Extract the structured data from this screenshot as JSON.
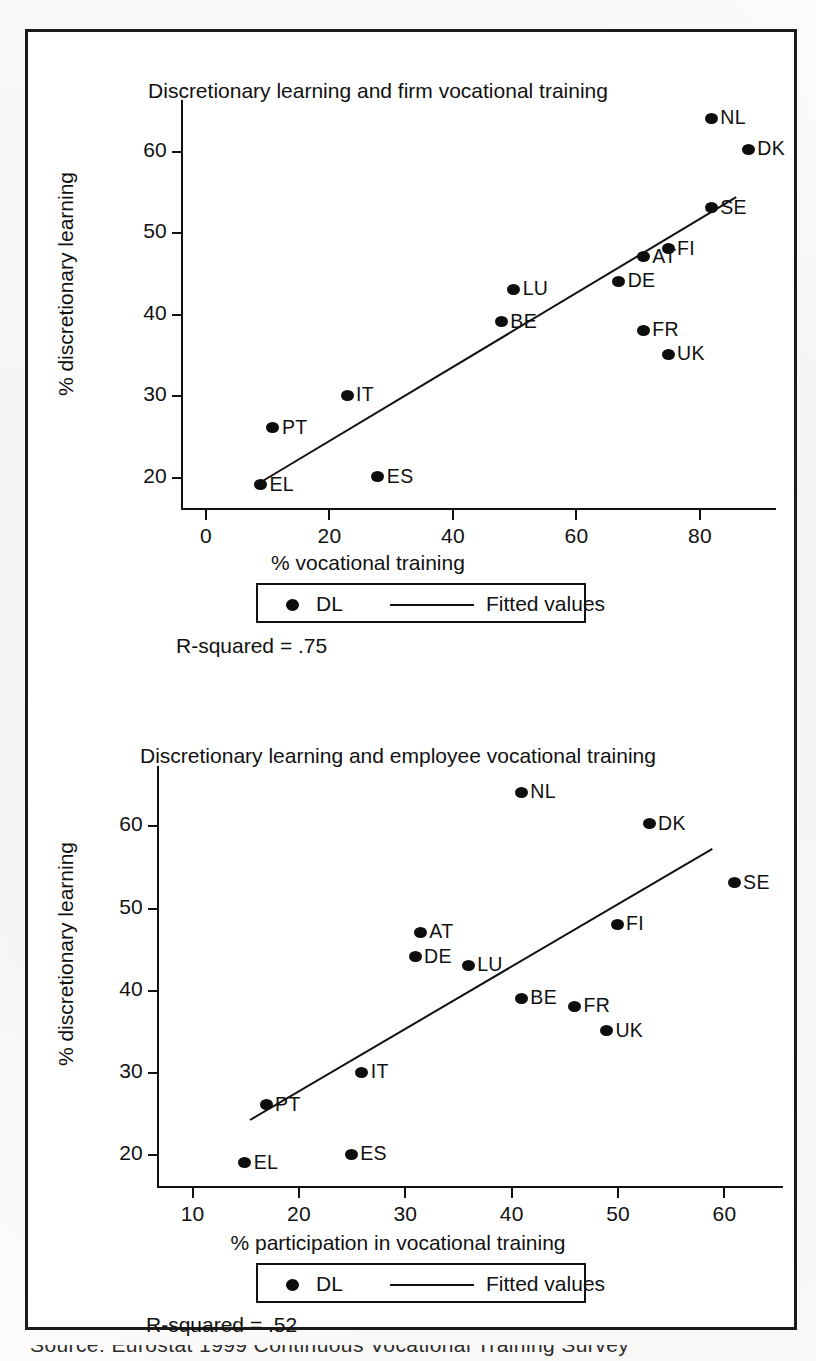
{
  "figure": {
    "caption_partial": "Source: Eurostat 1999 Continuous Vocational Training Survey"
  },
  "charts": [
    {
      "id": "chart-firm-vocational-training",
      "title": "Discretionary learning and firm vocational training",
      "rsquared_label": "R-squared = .75",
      "legend": {
        "point_label": "DL",
        "line_label": "Fitted values"
      },
      "xlabel": "% vocational training",
      "ylabel": "% discretionary learning",
      "xticks": [
        "0",
        "20",
        "40",
        "60",
        "80"
      ],
      "yticks": [
        "20",
        "30",
        "40",
        "50",
        "60"
      ],
      "points": [
        {
          "label": "NL",
          "x": 82,
          "y": 64
        },
        {
          "label": "DK",
          "x": 88,
          "y": 60.2
        },
        {
          "label": "SE",
          "x": 82,
          "y": 53
        },
        {
          "label": "FI",
          "x": 75,
          "y": 48
        },
        {
          "label": "AT",
          "x": 71,
          "y": 47
        },
        {
          "label": "DE",
          "x": 67,
          "y": 44
        },
        {
          "label": "LU",
          "x": 50,
          "y": 43
        },
        {
          "label": "BE",
          "x": 48,
          "y": 39
        },
        {
          "label": "FR",
          "x": 71,
          "y": 38
        },
        {
          "label": "UK",
          "x": 75,
          "y": 35
        },
        {
          "label": "IT",
          "x": 23,
          "y": 30
        },
        {
          "label": "PT",
          "x": 11,
          "y": 26
        },
        {
          "label": "ES",
          "x": 28,
          "y": 20
        },
        {
          "label": "EL",
          "x": 9,
          "y": 19
        }
      ]
    },
    {
      "id": "chart-employee-vocational-training",
      "title": "Discretionary learning and employee vocational training",
      "rsquared_label": "R-squared = .52",
      "legend": {
        "point_label": "DL",
        "line_label": "Fitted values"
      },
      "xlabel": "% participation in vocational training",
      "ylabel": "% discretionary learning",
      "xticks": [
        "10",
        "20",
        "30",
        "40",
        "50",
        "60"
      ],
      "yticks": [
        "20",
        "30",
        "40",
        "50",
        "60"
      ],
      "points": [
        {
          "label": "NL",
          "x": 41,
          "y": 64
        },
        {
          "label": "DK",
          "x": 53,
          "y": 60.2
        },
        {
          "label": "SE",
          "x": 61,
          "y": 53
        },
        {
          "label": "FI",
          "x": 50,
          "y": 48
        },
        {
          "label": "AT",
          "x": 31.5,
          "y": 47
        },
        {
          "label": "DE",
          "x": 31,
          "y": 44
        },
        {
          "label": "LU",
          "x": 36,
          "y": 43
        },
        {
          "label": "BE",
          "x": 41,
          "y": 39
        },
        {
          "label": "FR",
          "x": 46,
          "y": 38
        },
        {
          "label": "UK",
          "x": 49,
          "y": 35
        },
        {
          "label": "IT",
          "x": 26,
          "y": 30
        },
        {
          "label": "PT",
          "x": 17,
          "y": 26
        },
        {
          "label": "ES",
          "x": 25,
          "y": 20
        },
        {
          "label": "EL",
          "x": 15,
          "y": 19
        }
      ]
    }
  ],
  "chart_data": [
    {
      "type": "scatter",
      "title": "Discretionary learning and firm vocational training",
      "xlabel": "% vocational training",
      "ylabel": "% discretionary learning",
      "xlim": [
        0,
        92
      ],
      "ylim": [
        17,
        66
      ],
      "xticks": [
        0,
        20,
        40,
        60,
        80
      ],
      "yticks": [
        20,
        30,
        40,
        50,
        60
      ],
      "grid": false,
      "legend": [
        "DL",
        "Fitted values"
      ],
      "legend_position": "below-axis",
      "annotations": [
        "R-squared = .75"
      ],
      "series": [
        {
          "name": "DL",
          "points": [
            {
              "label": "NL",
              "x": 82,
              "y": 64
            },
            {
              "label": "DK",
              "x": 88,
              "y": 60.2
            },
            {
              "label": "SE",
              "x": 82,
              "y": 53
            },
            {
              "label": "FI",
              "x": 75,
              "y": 48
            },
            {
              "label": "AT",
              "x": 71,
              "y": 47
            },
            {
              "label": "DE",
              "x": 67,
              "y": 44
            },
            {
              "label": "LU",
              "x": 50,
              "y": 43
            },
            {
              "label": "BE",
              "x": 48,
              "y": 39
            },
            {
              "label": "FR",
              "x": 71,
              "y": 38
            },
            {
              "label": "UK",
              "x": 75,
              "y": 35
            },
            {
              "label": "IT",
              "x": 23,
              "y": 30
            },
            {
              "label": "PT",
              "x": 11,
              "y": 26
            },
            {
              "label": "ES",
              "x": 28,
              "y": 20
            },
            {
              "label": "EL",
              "x": 9,
              "y": 19
            }
          ]
        },
        {
          "name": "Fitted values",
          "type": "line",
          "endpoints": [
            {
              "x": 9,
              "y": 19.5
            },
            {
              "x": 86,
              "y": 54.5
            }
          ]
        }
      ]
    },
    {
      "type": "scatter",
      "title": "Discretionary learning and employee vocational training",
      "xlabel": "% participation in vocational training",
      "ylabel": "% discretionary learning",
      "xlim": [
        9,
        64
      ],
      "ylim": [
        17,
        66
      ],
      "xticks": [
        10,
        20,
        30,
        40,
        50,
        60
      ],
      "yticks": [
        20,
        30,
        40,
        50,
        60
      ],
      "grid": false,
      "legend": [
        "DL",
        "Fitted values"
      ],
      "legend_position": "below-axis",
      "annotations": [
        "R-squared = .52"
      ],
      "series": [
        {
          "name": "DL",
          "points": [
            {
              "label": "NL",
              "x": 41,
              "y": 64
            },
            {
              "label": "DK",
              "x": 53,
              "y": 60.2
            },
            {
              "label": "SE",
              "x": 61,
              "y": 53
            },
            {
              "label": "FI",
              "x": 50,
              "y": 48
            },
            {
              "label": "AT",
              "x": 31.5,
              "y": 47
            },
            {
              "label": "DE",
              "x": 31,
              "y": 44
            },
            {
              "label": "LU",
              "x": 36,
              "y": 43
            },
            {
              "label": "BE",
              "x": 41,
              "y": 39
            },
            {
              "label": "FR",
              "x": 46,
              "y": 38
            },
            {
              "label": "UK",
              "x": 49,
              "y": 35
            },
            {
              "label": "IT",
              "x": 26,
              "y": 30
            },
            {
              "label": "PT",
              "x": 17,
              "y": 26
            },
            {
              "label": "ES",
              "x": 25,
              "y": 20
            },
            {
              "label": "EL",
              "x": 15,
              "y": 19
            }
          ]
        },
        {
          "name": "Fitted values",
          "type": "line",
          "endpoints": [
            {
              "x": 15.5,
              "y": 24.3
            },
            {
              "x": 59,
              "y": 57.3
            }
          ]
        }
      ]
    }
  ]
}
